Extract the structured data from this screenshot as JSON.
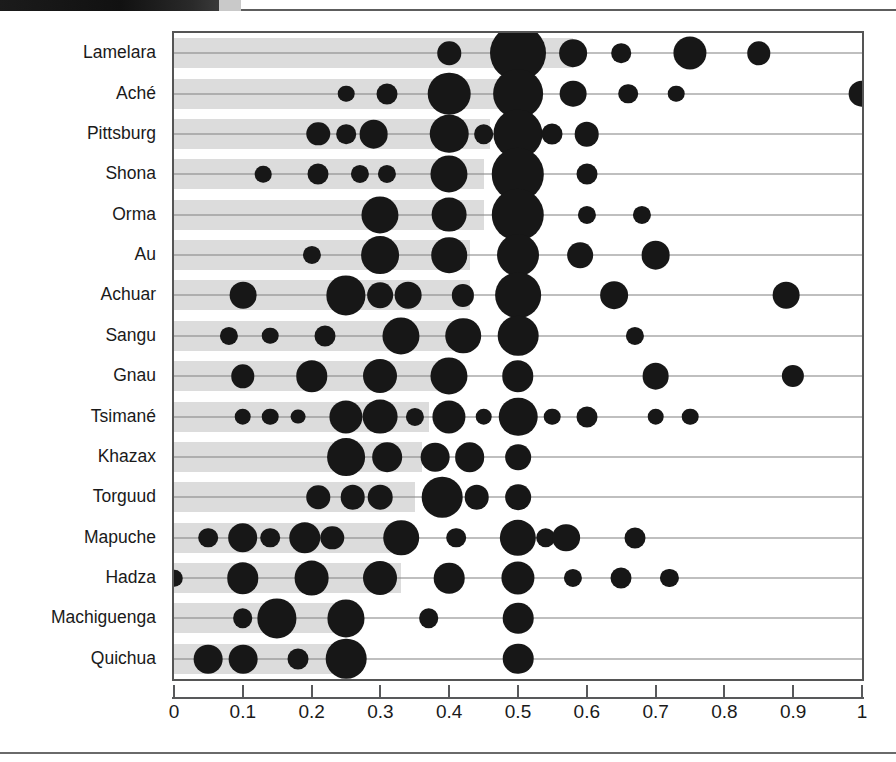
{
  "chart_data": {
    "type": "scatter",
    "title": "",
    "subtitle": "",
    "xlabel": "",
    "ylabel": "",
    "xlim": [
      0,
      1
    ],
    "ylim_categories_order": "top-to-bottom",
    "grid": false,
    "legend": null,
    "x_ticks": [
      0,
      0.1,
      0.2,
      0.3,
      0.4,
      0.5,
      0.6,
      0.7,
      0.8,
      0.9,
      1
    ],
    "x_tick_labels": [
      "0",
      "0.1",
      "0.2",
      "0.3",
      "0.4",
      "0.5",
      "0.6",
      "0.7",
      "0.8",
      "0.9",
      "1"
    ],
    "categories": [
      "Lamelara",
      "Aché",
      "Pittsburg",
      "Shona",
      "Orma",
      "Au",
      "Achuar",
      "Sangu",
      "Gnau",
      "Tsimané",
      "Khazax",
      "Torguud",
      "Mapuche",
      "Hadza",
      "Machiguenga",
      "Quichua"
    ],
    "marker_encoding": "bubble area proportional to relative frequency of that offer",
    "bar_encoding": "gray band spans from 0 to the group's mean offer",
    "series": [
      {
        "name": "Lamelara",
        "bar_end": 0.58,
        "points": [
          {
            "x": 0.4,
            "size": 0.1
          },
          {
            "x": 0.5,
            "size": 0.57
          },
          {
            "x": 0.58,
            "size": 0.14
          },
          {
            "x": 0.65,
            "size": 0.07
          },
          {
            "x": 0.75,
            "size": 0.2
          },
          {
            "x": 0.85,
            "size": 0.1
          }
        ]
      },
      {
        "name": "Aché",
        "bar_end": 0.5,
        "points": [
          {
            "x": 0.25,
            "size": 0.05
          },
          {
            "x": 0.31,
            "size": 0.08
          },
          {
            "x": 0.4,
            "size": 0.33
          },
          {
            "x": 0.5,
            "size": 0.45
          },
          {
            "x": 0.58,
            "size": 0.13
          },
          {
            "x": 0.66,
            "size": 0.07
          },
          {
            "x": 0.73,
            "size": 0.05
          },
          {
            "x": 1.0,
            "size": 0.13
          }
        ]
      },
      {
        "name": "Pittsburg",
        "bar_end": 0.46,
        "points": [
          {
            "x": 0.21,
            "size": 0.1
          },
          {
            "x": 0.25,
            "size": 0.07
          },
          {
            "x": 0.29,
            "size": 0.15
          },
          {
            "x": 0.4,
            "size": 0.27
          },
          {
            "x": 0.45,
            "size": 0.07
          },
          {
            "x": 0.5,
            "size": 0.44
          },
          {
            "x": 0.55,
            "size": 0.08
          },
          {
            "x": 0.6,
            "size": 0.11
          }
        ]
      },
      {
        "name": "Shona",
        "bar_end": 0.45,
        "points": [
          {
            "x": 0.13,
            "size": 0.05
          },
          {
            "x": 0.21,
            "size": 0.08
          },
          {
            "x": 0.27,
            "size": 0.06
          },
          {
            "x": 0.31,
            "size": 0.06
          },
          {
            "x": 0.4,
            "size": 0.25
          },
          {
            "x": 0.5,
            "size": 0.5
          },
          {
            "x": 0.6,
            "size": 0.08
          }
        ]
      },
      {
        "name": "Orma",
        "bar_end": 0.45,
        "points": [
          {
            "x": 0.3,
            "size": 0.25
          },
          {
            "x": 0.4,
            "size": 0.22
          },
          {
            "x": 0.5,
            "size": 0.5
          },
          {
            "x": 0.6,
            "size": 0.06
          },
          {
            "x": 0.68,
            "size": 0.06
          }
        ]
      },
      {
        "name": "Au",
        "bar_end": 0.43,
        "points": [
          {
            "x": 0.2,
            "size": 0.06
          },
          {
            "x": 0.3,
            "size": 0.26
          },
          {
            "x": 0.4,
            "size": 0.23
          },
          {
            "x": 0.5,
            "size": 0.32
          },
          {
            "x": 0.59,
            "size": 0.12
          },
          {
            "x": 0.7,
            "size": 0.15
          }
        ]
      },
      {
        "name": "Achuar",
        "bar_end": 0.43,
        "points": [
          {
            "x": 0.1,
            "size": 0.13
          },
          {
            "x": 0.25,
            "size": 0.28
          },
          {
            "x": 0.3,
            "size": 0.12
          },
          {
            "x": 0.34,
            "size": 0.13
          },
          {
            "x": 0.42,
            "size": 0.09
          },
          {
            "x": 0.5,
            "size": 0.38
          },
          {
            "x": 0.64,
            "size": 0.14
          },
          {
            "x": 0.89,
            "size": 0.13
          }
        ]
      },
      {
        "name": "Sangu",
        "bar_end": 0.42,
        "points": [
          {
            "x": 0.08,
            "size": 0.06
          },
          {
            "x": 0.14,
            "size": 0.05
          },
          {
            "x": 0.22,
            "size": 0.08
          },
          {
            "x": 0.33,
            "size": 0.25
          },
          {
            "x": 0.42,
            "size": 0.23
          },
          {
            "x": 0.5,
            "size": 0.3
          },
          {
            "x": 0.67,
            "size": 0.06
          }
        ]
      },
      {
        "name": "Gnau",
        "bar_end": 0.4,
        "points": [
          {
            "x": 0.1,
            "size": 0.1
          },
          {
            "x": 0.2,
            "size": 0.18
          },
          {
            "x": 0.3,
            "size": 0.21
          },
          {
            "x": 0.4,
            "size": 0.25
          },
          {
            "x": 0.5,
            "size": 0.18
          },
          {
            "x": 0.7,
            "size": 0.13
          },
          {
            "x": 0.9,
            "size": 0.09
          }
        ]
      },
      {
        "name": "Tsimané",
        "bar_end": 0.37,
        "points": [
          {
            "x": 0.1,
            "size": 0.05
          },
          {
            "x": 0.14,
            "size": 0.05
          },
          {
            "x": 0.18,
            "size": 0.04
          },
          {
            "x": 0.25,
            "size": 0.2
          },
          {
            "x": 0.3,
            "size": 0.22
          },
          {
            "x": 0.35,
            "size": 0.06
          },
          {
            "x": 0.4,
            "size": 0.2
          },
          {
            "x": 0.45,
            "size": 0.05
          },
          {
            "x": 0.5,
            "size": 0.27
          },
          {
            "x": 0.55,
            "size": 0.05
          },
          {
            "x": 0.6,
            "size": 0.08
          },
          {
            "x": 0.7,
            "size": 0.05
          },
          {
            "x": 0.75,
            "size": 0.05
          }
        ]
      },
      {
        "name": "Khazax",
        "bar_end": 0.36,
        "points": [
          {
            "x": 0.25,
            "size": 0.26
          },
          {
            "x": 0.31,
            "size": 0.16
          },
          {
            "x": 0.38,
            "size": 0.15
          },
          {
            "x": 0.43,
            "size": 0.16
          },
          {
            "x": 0.5,
            "size": 0.12
          }
        ]
      },
      {
        "name": "Torguud",
        "bar_end": 0.35,
        "points": [
          {
            "x": 0.21,
            "size": 0.1
          },
          {
            "x": 0.26,
            "size": 0.11
          },
          {
            "x": 0.3,
            "size": 0.11
          },
          {
            "x": 0.39,
            "size": 0.3
          },
          {
            "x": 0.44,
            "size": 0.11
          },
          {
            "x": 0.5,
            "size": 0.12
          }
        ]
      },
      {
        "name": "Mapuche",
        "bar_end": 0.33,
        "points": [
          {
            "x": 0.05,
            "size": 0.07
          },
          {
            "x": 0.1,
            "size": 0.16
          },
          {
            "x": 0.14,
            "size": 0.07
          },
          {
            "x": 0.19,
            "size": 0.18
          },
          {
            "x": 0.23,
            "size": 0.1
          },
          {
            "x": 0.33,
            "size": 0.23
          },
          {
            "x": 0.41,
            "size": 0.07
          },
          {
            "x": 0.5,
            "size": 0.24
          },
          {
            "x": 0.54,
            "size": 0.07
          },
          {
            "x": 0.57,
            "size": 0.14
          },
          {
            "x": 0.67,
            "size": 0.08
          }
        ]
      },
      {
        "name": "Hadza",
        "bar_end": 0.33,
        "points": [
          {
            "x": 0.0,
            "size": 0.05
          },
          {
            "x": 0.1,
            "size": 0.18
          },
          {
            "x": 0.2,
            "size": 0.22
          },
          {
            "x": 0.3,
            "size": 0.21
          },
          {
            "x": 0.4,
            "size": 0.17
          },
          {
            "x": 0.5,
            "size": 0.2
          },
          {
            "x": 0.58,
            "size": 0.06
          },
          {
            "x": 0.65,
            "size": 0.08
          },
          {
            "x": 0.72,
            "size": 0.06
          }
        ]
      },
      {
        "name": "Machiguenga",
        "bar_end": 0.26,
        "points": [
          {
            "x": 0.1,
            "size": 0.07
          },
          {
            "x": 0.15,
            "size": 0.28
          },
          {
            "x": 0.25,
            "size": 0.25
          },
          {
            "x": 0.37,
            "size": 0.07
          },
          {
            "x": 0.5,
            "size": 0.17
          }
        ]
      },
      {
        "name": "Quichua",
        "bar_end": 0.26,
        "points": [
          {
            "x": 0.05,
            "size": 0.15
          },
          {
            "x": 0.1,
            "size": 0.15
          },
          {
            "x": 0.18,
            "size": 0.08
          },
          {
            "x": 0.25,
            "size": 0.3
          },
          {
            "x": 0.5,
            "size": 0.17
          }
        ]
      }
    ]
  },
  "style": {
    "band_color": "#dcdcdc",
    "dot_color": "#171717",
    "line_color": "#808080",
    "frame_color": "#555555",
    "axis_color": "#58595b",
    "text_color": "#1a1a1a",
    "background": "#ffffff"
  }
}
